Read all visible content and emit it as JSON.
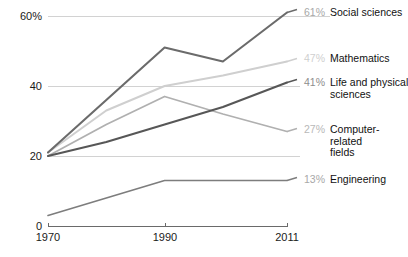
{
  "chart_data": {
    "type": "line",
    "title": "",
    "xlabel": "",
    "ylabel": "",
    "x": [
      1970,
      1980,
      1990,
      2000,
      2011
    ],
    "xtick_labels": [
      "1970",
      "1990",
      "2011"
    ],
    "xticks": [
      1970,
      1990,
      2011
    ],
    "ytick_labels": [
      "0",
      "20",
      "40",
      "60%"
    ],
    "yticks": [
      0,
      20,
      40,
      60
    ],
    "ylim": [
      0,
      60
    ],
    "xlim": [
      1970,
      2011
    ],
    "grid": "horizontal",
    "legend": "right-inline-labels",
    "series": [
      {
        "name": "Social sciences",
        "end_value_label": "61%",
        "color": "#6b6b6b",
        "values": [
          21,
          36,
          51,
          47,
          61
        ]
      },
      {
        "name": "Mathematics",
        "end_value_label": "47%",
        "color": "#cfcfcf",
        "values": [
          21,
          33,
          40,
          43,
          47
        ]
      },
      {
        "name": "Life and physical sciences",
        "name_line1": "Life and physical",
        "name_line2": "sciences",
        "end_value_label": "41%",
        "color": "#575757",
        "values": [
          20,
          24,
          29,
          34,
          41
        ]
      },
      {
        "name": "Computer-related fields",
        "name_line1": "Computer-",
        "name_line2": "related",
        "name_line3": "fields",
        "end_value_label": "27%",
        "color": "#b0b0b0",
        "values": [
          20,
          29,
          37,
          32,
          27
        ]
      },
      {
        "name": "Engineering",
        "end_value_label": "13%",
        "color": "#7d7d7d",
        "values": [
          3,
          8,
          13,
          13,
          13
        ]
      }
    ]
  },
  "axis": {
    "y0": "0",
    "y20": "20",
    "y40": "40",
    "y60": "60%",
    "x1": "1970",
    "x2": "1990",
    "x3": "2011"
  },
  "labels": {
    "social_value": "61%",
    "social_name": "Social sciences",
    "math_value": "47%",
    "math_name": "Mathematics",
    "life_value": "41%",
    "life_name_1": "Life and physical",
    "life_name_2": "sciences",
    "comp_value": "27%",
    "comp_name_1": "Computer-",
    "comp_name_2": "related",
    "comp_name_3": "fields",
    "eng_value": "13%",
    "eng_name": "Engineering"
  }
}
